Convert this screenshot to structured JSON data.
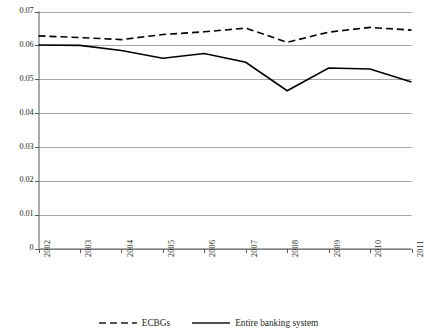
{
  "chart_data": {
    "type": "line",
    "title": "",
    "subtitle": "",
    "xlabel": "",
    "ylabel": "",
    "categories": [
      "2002",
      "2003",
      "2004",
      "2005",
      "2006",
      "2007",
      "2008",
      "2009",
      "2010",
      "2011"
    ],
    "ylim": [
      0,
      0.07
    ],
    "ytick_values": [
      0,
      0.01,
      0.02,
      0.03,
      0.04,
      0.05,
      0.06,
      0.07
    ],
    "ytick_labels": [
      "0",
      "0.01",
      "0.02",
      "0.03",
      "0.04",
      "0.05",
      "0.06",
      "0.07"
    ],
    "grid": true,
    "grid_axis": "y",
    "legend_position": "bottom",
    "series": [
      {
        "name": "ECBGs",
        "style": "dashed",
        "color": "#000000",
        "values": [
          0.0628,
          0.0623,
          0.0617,
          0.0632,
          0.064,
          0.0651,
          0.0609,
          0.0639,
          0.0653,
          0.0645
        ]
      },
      {
        "name": "Entire banking system",
        "style": "solid",
        "color": "#000000",
        "values": [
          0.0601,
          0.06,
          0.0585,
          0.0562,
          0.0576,
          0.055,
          0.0466,
          0.0533,
          0.053,
          0.0492
        ]
      }
    ]
  },
  "legend": {
    "items": [
      {
        "label": "ECBGs",
        "style": "dashed"
      },
      {
        "label": "Entire banking system",
        "style": "solid"
      }
    ]
  },
  "colors": {
    "line": "#1a1a1a",
    "grid": "#a6a6a6",
    "axis": "#5a5a5a",
    "text": "#231f20",
    "background": "#ffffff"
  }
}
